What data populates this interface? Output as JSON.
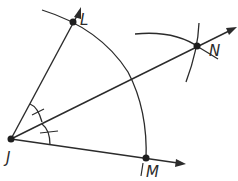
{
  "diagram": {
    "vertex": {
      "label": "J",
      "x": 11,
      "y": 139
    },
    "points": [
      {
        "id": "L",
        "label": "L",
        "x": 73,
        "y": 22
      },
      {
        "id": "N",
        "label": "N",
        "x": 197,
        "y": 46
      },
      {
        "id": "M",
        "label": "M",
        "x": 146,
        "y": 158
      }
    ],
    "rays": [
      {
        "from": "J",
        "through": "L",
        "name": "ray-JL"
      },
      {
        "from": "J",
        "through": "N",
        "name": "ray-JN"
      },
      {
        "from": "J",
        "through": "M",
        "name": "ray-JM"
      }
    ],
    "congruent_angle_marks": 2,
    "line_color": "#2b2b2b"
  }
}
